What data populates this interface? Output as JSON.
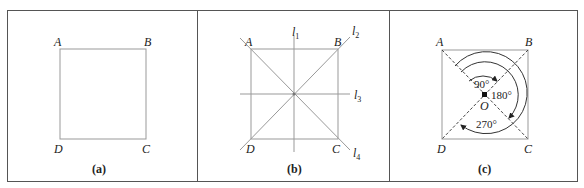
{
  "panels": [
    {
      "caption": "(a)",
      "vertices": {
        "A": "A",
        "B": "B",
        "C": "C",
        "D": "D"
      }
    },
    {
      "caption": "(b)",
      "vertices": {
        "A": "A",
        "B": "B",
        "C": "C",
        "D": "D"
      },
      "axes": {
        "l1": "l",
        "l1_sub": "1",
        "l2": "l",
        "l2_sub": "2",
        "l3": "l",
        "l3_sub": "3",
        "l4": "l",
        "l4_sub": "4"
      }
    },
    {
      "caption": "(c)",
      "vertices": {
        "A": "A",
        "B": "B",
        "C": "C",
        "D": "D"
      },
      "center": "O",
      "angles": {
        "a90": "90°",
        "a180": "180°",
        "a270": "270°"
      }
    }
  ],
  "colors": {
    "border": "#555555",
    "line": "#999999",
    "text": "#222222"
  }
}
